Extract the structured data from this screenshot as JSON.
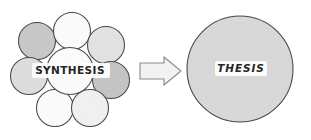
{
  "diagram": {
    "background_color": "#ffffff",
    "stroke_color": "#3c3c3c",
    "arrow_stroke_color": "#8a8a8a",
    "arrow_fill_color": "#f2f2f2",
    "text_color": "#262626",
    "cluster": {
      "name": "synthesis-cluster",
      "center_label": "SYNTHESIS",
      "circle_count": 8,
      "circles": [
        {
          "id": "top-left",
          "cx": 37,
          "cy": 41,
          "r": 18.5,
          "fill": "#c8c8c8"
        },
        {
          "id": "top-center",
          "cx": 72,
          "cy": 31,
          "r": 18.5,
          "fill": "#fdfdfd"
        },
        {
          "id": "top-right",
          "cx": 106,
          "cy": 45,
          "r": 18.5,
          "fill": "#e3e3e3"
        },
        {
          "id": "left-middle",
          "cx": 29,
          "cy": 76,
          "r": 18.5,
          "fill": "#dedede"
        },
        {
          "id": "right-middle",
          "cx": 111,
          "cy": 80,
          "r": 18.5,
          "fill": "#c4c4c4"
        },
        {
          "id": "bottom-left",
          "cx": 55,
          "cy": 108,
          "r": 18.5,
          "fill": "#fdfdfd"
        },
        {
          "id": "bottom-right",
          "cx": 90,
          "cy": 108,
          "r": 18.5,
          "fill": "#f2f2f2"
        },
        {
          "id": "center",
          "cx": 70,
          "cy": 71,
          "r": 23.5,
          "fill": "#fdfdfd"
        }
      ]
    },
    "arrow": {
      "name": "transform-arrow",
      "direction": "right",
      "x_start": 140,
      "x_end": 181,
      "y_center": 71
    },
    "result": {
      "name": "thesis-circle",
      "label": "THESIS",
      "cx": 240,
      "cy": 69,
      "r": 53,
      "fill": "#d9d9d9",
      "label_background": "#fdfdfd"
    }
  }
}
